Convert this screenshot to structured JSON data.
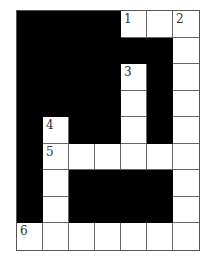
{
  "puzzle": {
    "type": "crossword",
    "rows": 9,
    "cols": 7,
    "grid": [
      [
        "B",
        "B",
        "B",
        "B",
        "W",
        "W",
        "W"
      ],
      [
        "B",
        "B",
        "B",
        "B",
        "B",
        "B",
        "W"
      ],
      [
        "B",
        "B",
        "B",
        "B",
        "W",
        "B",
        "W"
      ],
      [
        "B",
        "B",
        "B",
        "B",
        "W",
        "B",
        "W"
      ],
      [
        "B",
        "W",
        "B",
        "B",
        "W",
        "B",
        "W"
      ],
      [
        "B",
        "W",
        "W",
        "W",
        "W",
        "W",
        "W"
      ],
      [
        "B",
        "W",
        "B",
        "B",
        "B",
        "B",
        "W"
      ],
      [
        "B",
        "W",
        "B",
        "B",
        "B",
        "B",
        "W"
      ],
      [
        "W",
        "W",
        "W",
        "W",
        "W",
        "W",
        "W"
      ]
    ],
    "numbers": [
      {
        "row": 0,
        "col": 4,
        "label": "1"
      },
      {
        "row": 0,
        "col": 6,
        "label": "2"
      },
      {
        "row": 2,
        "col": 4,
        "label": "3"
      },
      {
        "row": 4,
        "col": 1,
        "label": "4"
      },
      {
        "row": 5,
        "col": 1,
        "label": "5"
      },
      {
        "row": 8,
        "col": 0,
        "label": "6"
      }
    ],
    "colors": {
      "block": "#000000",
      "cell": "#ffffff",
      "line": "#666666",
      "number": "#333333"
    }
  }
}
